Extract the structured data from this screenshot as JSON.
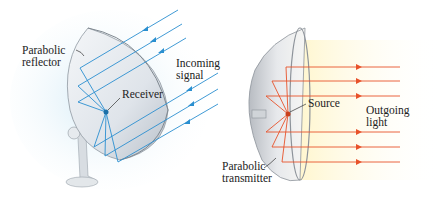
{
  "left_panel": {
    "labels": {
      "reflector": [
        "Parabolic",
        "reflector"
      ],
      "signal": [
        "Incoming",
        "signal"
      ],
      "receiver": "Receiver"
    },
    "ray_color": "#2a8fd0"
  },
  "right_panel": {
    "labels": {
      "source": "Source",
      "light": [
        "Outgoing",
        "light"
      ],
      "transmitter": [
        "Parabolic",
        "transmitter"
      ]
    },
    "ray_color": "#e8522a"
  }
}
